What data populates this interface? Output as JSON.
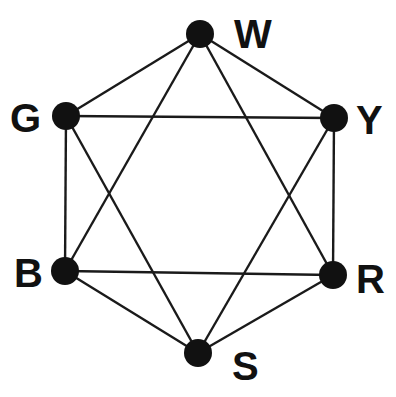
{
  "diagram": {
    "type": "graph",
    "colors": {
      "node": "#111111",
      "edge": "#1a1a1a",
      "background": "#ffffff"
    },
    "nodes": [
      {
        "id": "W",
        "label": "W",
        "x": 200,
        "y": 34,
        "lx": 234,
        "ly": 48
      },
      {
        "id": "G",
        "label": "G",
        "x": 66,
        "y": 116,
        "lx": 10,
        "ly": 132
      },
      {
        "id": "Y",
        "label": "Y",
        "x": 334,
        "y": 118,
        "lx": 356,
        "ly": 134
      },
      {
        "id": "B",
        "label": "B",
        "x": 65,
        "y": 271,
        "lx": 14,
        "ly": 287
      },
      {
        "id": "R",
        "label": "R",
        "x": 333,
        "y": 275,
        "lx": 356,
        "ly": 293
      },
      {
        "id": "S",
        "label": "S",
        "x": 198,
        "y": 353,
        "lx": 232,
        "ly": 380
      }
    ],
    "edges": [
      [
        "W",
        "G"
      ],
      [
        "W",
        "Y"
      ],
      [
        "W",
        "B"
      ],
      [
        "W",
        "R"
      ],
      [
        "G",
        "Y"
      ],
      [
        "G",
        "B"
      ],
      [
        "G",
        "S"
      ],
      [
        "Y",
        "R"
      ],
      [
        "Y",
        "S"
      ],
      [
        "B",
        "R"
      ],
      [
        "B",
        "S"
      ],
      [
        "R",
        "S"
      ]
    ]
  }
}
